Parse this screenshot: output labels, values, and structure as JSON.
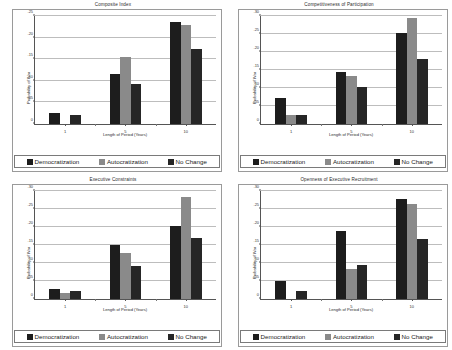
{
  "figure": {
    "series_names": [
      "Democratization",
      "Autocratization",
      "No Change"
    ],
    "series_colors": [
      "#1d1d1d",
      "#8a8a8a",
      "#262626"
    ],
    "xlabel": "Length of Period (Years)",
    "ylabel": "Probability of War",
    "categories": [
      "1",
      "5",
      "10"
    ]
  },
  "chart_data": [
    {
      "type": "bar",
      "title": "Composite Index",
      "xlabel": "Length of Period (Years)",
      "ylabel": "Probability of War",
      "categories": [
        "1",
        "5",
        "10"
      ],
      "series": [
        {
          "name": "Democratization",
          "values": [
            0.025,
            0.115,
            0.235
          ]
        },
        {
          "name": "Autocratization",
          "values": [
            0.0,
            0.155,
            0.23
          ]
        },
        {
          "name": "No Change",
          "values": [
            0.021,
            0.093,
            0.173
          ]
        }
      ],
      "ylim": [
        0,
        0.25
      ],
      "yticks": [
        0,
        0.05,
        0.1,
        0.15,
        0.2,
        0.25
      ],
      "ytick_labels": [
        "0",
        ".05",
        ".10",
        ".15",
        ".20",
        ".25"
      ],
      "grid": true,
      "legend_position": "bottom"
    },
    {
      "type": "bar",
      "title": "Competitiveness of Participation",
      "xlabel": "Length of Period (Years)",
      "ylabel": "Probability of War",
      "categories": [
        "1",
        "5",
        "10"
      ],
      "series": [
        {
          "name": "Democratization",
          "values": [
            0.072,
            0.145,
            0.253
          ]
        },
        {
          "name": "Autocratization",
          "values": [
            0.025,
            0.132,
            0.295
          ]
        },
        {
          "name": "No Change",
          "values": [
            0.024,
            0.102,
            0.18
          ]
        }
      ],
      "ylim": [
        0,
        0.3
      ],
      "yticks": [
        0,
        0.05,
        0.1,
        0.15,
        0.2,
        0.25,
        0.3
      ],
      "ytick_labels": [
        "0",
        ".05",
        ".10",
        ".15",
        ".20",
        ".25",
        ".30"
      ],
      "grid": true,
      "legend_position": "bottom"
    },
    {
      "type": "bar",
      "title": "Executive Constraints",
      "xlabel": "Length of Period (Years)",
      "ylabel": "Probability of War",
      "categories": [
        "1",
        "5",
        "10"
      ],
      "series": [
        {
          "name": "Democratization",
          "values": [
            0.028,
            0.15,
            0.202
          ]
        },
        {
          "name": "Autocratization",
          "values": [
            0.018,
            0.128,
            0.282
          ]
        },
        {
          "name": "No Change",
          "values": [
            0.022,
            0.093,
            0.17
          ]
        }
      ],
      "ylim": [
        0,
        0.3
      ],
      "yticks": [
        0,
        0.05,
        0.1,
        0.15,
        0.2,
        0.25,
        0.3
      ],
      "ytick_labels": [
        "0",
        ".05",
        ".10",
        ".15",
        ".20",
        ".25",
        ".30"
      ],
      "grid": true,
      "legend_position": "bottom"
    },
    {
      "type": "bar",
      "title": "Openness of Executive Recruitment",
      "xlabel": "Length of Period (Years)",
      "ylabel": "Probability of War",
      "categories": [
        "1",
        "5",
        "10"
      ],
      "series": [
        {
          "name": "Democratization",
          "values": [
            0.05,
            0.19,
            0.277
          ]
        },
        {
          "name": "Autocratization",
          "values": [
            0.0,
            0.084,
            0.265
          ]
        },
        {
          "name": "No Change",
          "values": [
            0.022,
            0.094,
            0.168
          ]
        }
      ],
      "ylim": [
        0,
        0.3
      ],
      "yticks": [
        0,
        0.05,
        0.1,
        0.15,
        0.2,
        0.25,
        0.3
      ],
      "ytick_labels": [
        "0",
        ".05",
        ".10",
        ".15",
        ".20",
        ".25",
        ".30"
      ],
      "grid": true,
      "legend_position": "bottom"
    }
  ]
}
